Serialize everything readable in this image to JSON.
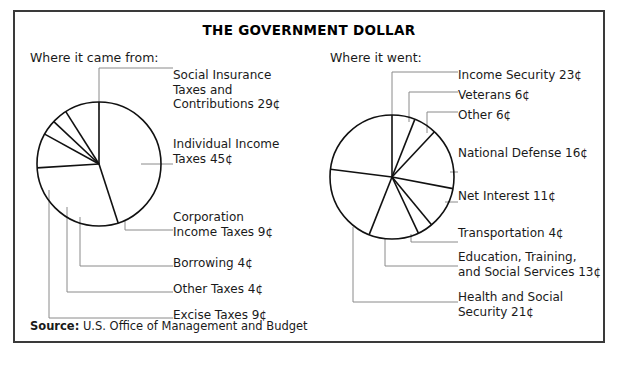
{
  "title": "THE GOVERNMENT DOLLAR",
  "source": {
    "label": "Source:",
    "text": "U.S. Office of Management and Budget"
  },
  "panels": {
    "left": {
      "heading": "Where it came from:"
    },
    "right": {
      "heading": "Where it went:"
    }
  },
  "labels": {
    "left": [
      "Social Insurance\nTaxes and\nContributions 29¢",
      "Individual Income\nTaxes 45¢",
      "Corporation\nIncome Taxes 9¢",
      "Borrowing 4¢",
      "Other Taxes 4¢",
      "Excise Taxes 9¢"
    ],
    "right": [
      "Income Security 23¢",
      "Veterans 6¢",
      "Other 6¢",
      "National Defense 16¢",
      "Net Interest 11¢",
      "Transportation 4¢",
      "Education, Training,\nand Social Services 13¢",
      "Health and Social\nSecurity 21¢"
    ]
  },
  "colors": {
    "frame": "#3a3a3a",
    "pie_stroke": "#111111",
    "leader": "#8a8a8a",
    "text": "#1a1a1a"
  },
  "chart_data": [
    {
      "type": "pie",
      "title": "Where it came from:",
      "units": "cents per dollar",
      "total": 100,
      "categories": [
        "Individual Income Taxes",
        "Social Insurance Taxes and Contributions",
        "Excise Taxes",
        "Other Taxes",
        "Borrowing",
        "Corporation Income Taxes"
      ],
      "values": [
        45,
        29,
        9,
        4,
        4,
        9
      ],
      "labels": [
        "Individual Income Taxes 45¢",
        "Social Insurance Taxes and Contributions 29¢",
        "Excise Taxes 9¢",
        "Other Taxes 4¢",
        "Borrowing 4¢",
        "Corporation Income Taxes 9¢"
      ],
      "start_angle_deg": 0,
      "direction": "clockwise",
      "legend": "leader-lines"
    },
    {
      "type": "pie",
      "title": "Where it went:",
      "units": "cents per dollar",
      "total": 100,
      "categories": [
        "Veterans",
        "Other",
        "National Defense",
        "Net Interest",
        "Transportation",
        "Education, Training, and Social Services",
        "Health and Social Security",
        "Income Security"
      ],
      "values": [
        6,
        6,
        16,
        11,
        4,
        13,
        21,
        23
      ],
      "labels": [
        "Veterans 6¢",
        "Other 6¢",
        "National Defense 16¢",
        "Net Interest 11¢",
        "Transportation 4¢",
        "Education, Training, and Social Services 13¢",
        "Health and Social Security 21¢",
        "Income Security 23¢"
      ],
      "start_angle_deg": 0,
      "direction": "clockwise",
      "legend": "leader-lines"
    }
  ]
}
